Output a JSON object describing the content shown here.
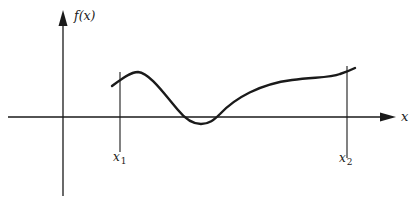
{
  "diagram": {
    "type": "function-graph",
    "y_axis_label": "f(x)",
    "x_axis_label": "x",
    "markers": [
      {
        "label_base": "x",
        "label_sub": "1"
      },
      {
        "label_base": "x",
        "label_sub": "2"
      }
    ],
    "colors": {
      "stroke": "#1a1a1a",
      "background": "#ffffff"
    }
  }
}
